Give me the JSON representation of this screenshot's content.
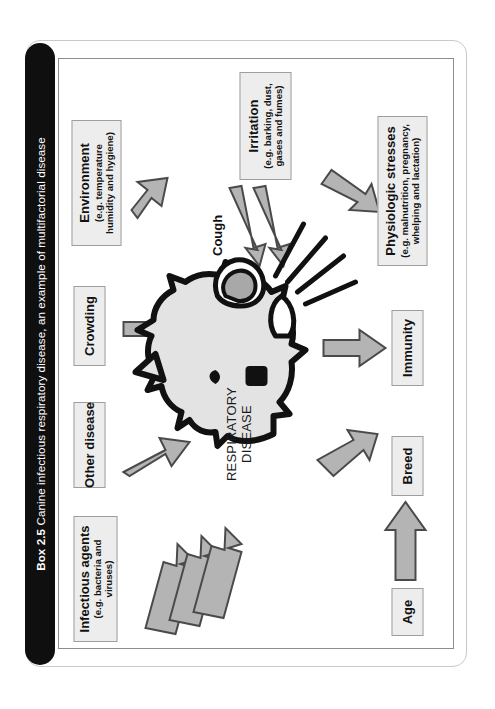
{
  "figure": {
    "box_number": "Box 2.5",
    "title": "Canine infectious respiratory disease, an example of multifactorial disease",
    "centre_label_line1": "RESPIRATORY",
    "centre_label_line2": "DISEASE",
    "cough_label": "Cough",
    "illustration": "coughing-dog-head"
  },
  "factors": [
    {
      "id": "infectious-agents",
      "title": "Infectious agents",
      "subtitle": "(e.g. bacteria and viruses)",
      "arrows": 3
    },
    {
      "id": "other-disease",
      "title": "Other disease",
      "subtitle": "",
      "arrows": 1
    },
    {
      "id": "crowding",
      "title": "Crowding",
      "subtitle": "",
      "arrows": 1
    },
    {
      "id": "environment",
      "title": "Environment",
      "subtitle": "(e.g. temperature humidity and hygiene)",
      "arrows": 1
    },
    {
      "id": "age",
      "title": "Age",
      "subtitle": "",
      "arrows": 1
    },
    {
      "id": "breed",
      "title": "Breed",
      "subtitle": "",
      "arrows": 1
    },
    {
      "id": "immunity",
      "title": "Immunity",
      "subtitle": "",
      "arrows": 1
    },
    {
      "id": "physiologic-stresses",
      "title": "Physiologic stresses",
      "subtitle": "(e.g. malnutrition, pregnancy, whelping and lactation)",
      "arrows": 1
    },
    {
      "id": "irritation",
      "title": "Irritation",
      "subtitle": "(e.g. barking, dust, gases and fumes)",
      "arrows": 2
    }
  ],
  "colors": {
    "title_bar": "#100f0f",
    "title_text": "#ffffff",
    "box_fill": "#ededed",
    "box_border": "#9e9e9e",
    "arrow_fill": "#b4b4b4",
    "arrow_stroke": "#4a4a4a",
    "page_background": "#ffffff",
    "dog_fill": "#e3e3e3",
    "dog_outline": "#111111"
  }
}
